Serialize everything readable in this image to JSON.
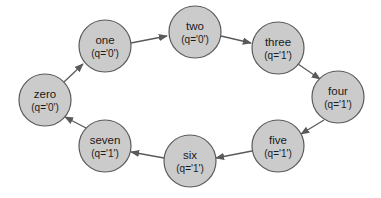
{
  "diagram": {
    "type": "state-machine-cycle",
    "colors": {
      "node_fill": "#cbcbcb",
      "node_stroke": "#5a5a5a",
      "edge": "#5a5a5a",
      "text": "#1a1a1a"
    },
    "nodes": [
      {
        "id": "zero",
        "label": "zero",
        "sub": "(q='0')",
        "x": 45,
        "y": 100
      },
      {
        "id": "one",
        "label": "one",
        "sub": "(q='0')",
        "x": 105,
        "y": 46
      },
      {
        "id": "two",
        "label": "two",
        "sub": "(q='0')",
        "x": 195,
        "y": 32
      },
      {
        "id": "three",
        "label": "three",
        "sub": "(q='1')",
        "x": 278,
        "y": 48
      },
      {
        "id": "four",
        "label": "four",
        "sub": "(q='1')",
        "x": 338,
        "y": 97
      },
      {
        "id": "five",
        "label": "five",
        "sub": "(q='1')",
        "x": 278,
        "y": 146
      },
      {
        "id": "six",
        "label": "six",
        "sub": "(q='1')",
        "x": 190,
        "y": 161
      },
      {
        "id": "seven",
        "label": "seven",
        "sub": "(q='1')",
        "x": 105,
        "y": 146
      }
    ],
    "edges": [
      {
        "from": "zero",
        "to": "one"
      },
      {
        "from": "one",
        "to": "two"
      },
      {
        "from": "two",
        "to": "three"
      },
      {
        "from": "three",
        "to": "four"
      },
      {
        "from": "four",
        "to": "five"
      },
      {
        "from": "five",
        "to": "six"
      },
      {
        "from": "six",
        "to": "seven"
      },
      {
        "from": "seven",
        "to": "zero"
      }
    ]
  }
}
